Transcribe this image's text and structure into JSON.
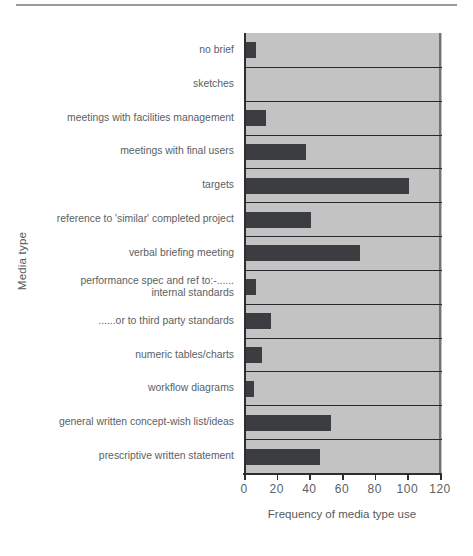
{
  "chart_data": {
    "type": "bar",
    "orientation": "horizontal",
    "title": "",
    "xlabel": "Frequency of media type use",
    "ylabel": "Media type",
    "xlim": [
      0,
      120
    ],
    "xticks": [
      0,
      20,
      40,
      60,
      80,
      100,
      120
    ],
    "grid": false,
    "legend": null,
    "bar_color": "#3b3d40",
    "plot_background": "#c3c3c3",
    "categories": [
      "no brief",
      "sketches",
      "meetings with facilities management",
      "meetings with final users",
      "targets",
      "reference to 'similar' completed project",
      "verbal briefing meeting",
      "performance spec and ref to:-...... internal standards",
      "......or to third party standards",
      "numeric tables/charts",
      "workflow diagrams",
      "general written concept-wish list/ideas",
      "prescriptive written statement"
    ],
    "category_lines": [
      [
        "no brief"
      ],
      [
        "sketches"
      ],
      [
        "meetings with facilities management"
      ],
      [
        "meetings with final users"
      ],
      [
        "targets"
      ],
      [
        "reference to 'similar' completed project"
      ],
      [
        "verbal briefing meeting"
      ],
      [
        "performance spec and ref to:-......",
        "internal standards"
      ],
      [
        "......or to third party standards"
      ],
      [
        "numeric tables/charts"
      ],
      [
        "workflow diagrams"
      ],
      [
        "general written concept-wish list/ideas"
      ],
      [
        "prescriptive written statement"
      ]
    ],
    "values": [
      6,
      0,
      12,
      37,
      100,
      40,
      70,
      6,
      15,
      10,
      5,
      52,
      45
    ]
  }
}
